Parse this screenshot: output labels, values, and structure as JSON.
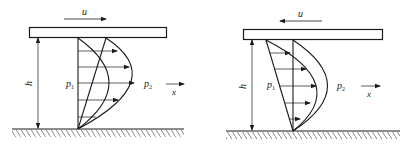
{
  "figures": [
    {
      "id": "left",
      "velocity_label": "u",
      "velocity_direction": "right",
      "height_label": "h",
      "pressure_left_label": "p",
      "pressure_left_sub": "1",
      "pressure_right_label": "p",
      "pressure_right_sub": "2",
      "axis_label": "x"
    },
    {
      "id": "right",
      "velocity_label": "u",
      "velocity_direction": "left",
      "height_label": "h",
      "pressure_left_label": "p",
      "pressure_left_sub": "1",
      "pressure_right_label": "p",
      "pressure_right_sub": "2",
      "axis_label": "x"
    }
  ],
  "colors": {
    "line": "#1a1a1a",
    "background": "#ffffff"
  }
}
